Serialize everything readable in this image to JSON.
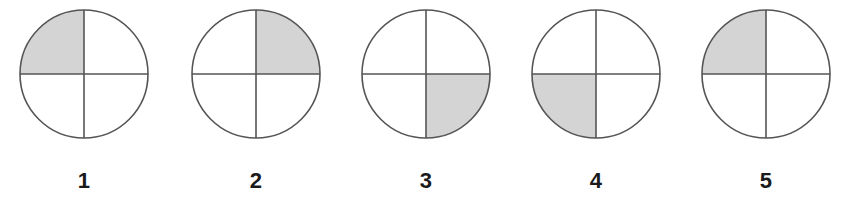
{
  "figure": {
    "title": "",
    "background_color": "#ffffff",
    "stroke_color": "#555555",
    "shade_color": "#d4d4d4",
    "label_color": "#1a1a1a",
    "circle_count": 5,
    "circle_radius": 64,
    "circle_center_y": 74,
    "items": [
      {
        "id": "circle-1",
        "label": "1",
        "center_x": 84,
        "shaded_quadrant": "top-left",
        "shaded_fraction": "1/4"
      },
      {
        "id": "circle-2",
        "label": "2",
        "center_x": 256,
        "shaded_quadrant": "top-right",
        "shaded_fraction": "1/4"
      },
      {
        "id": "circle-3",
        "label": "3",
        "center_x": 426,
        "shaded_quadrant": "bottom-right",
        "shaded_fraction": "1/4"
      },
      {
        "id": "circle-4",
        "label": "4",
        "center_x": 596,
        "shaded_quadrant": "bottom-left",
        "shaded_fraction": "1/4"
      },
      {
        "id": "circle-5",
        "label": "5",
        "center_x": 766,
        "shaded_quadrant": "top-left",
        "shaded_fraction": "1/4"
      }
    ]
  }
}
